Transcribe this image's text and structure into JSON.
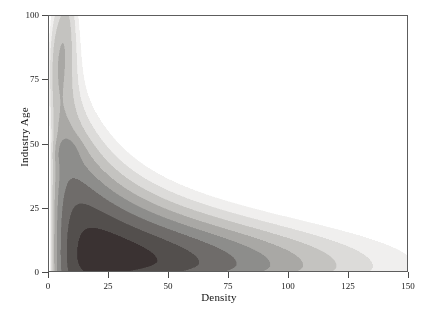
{
  "chart_data": {
    "type": "heatmap",
    "subtype": "filled-contour-density",
    "title": "",
    "xlabel": "Density",
    "ylabel": "Industry Age",
    "xlim": [
      0,
      150
    ],
    "ylim": [
      0,
      100
    ],
    "xticks": [
      0,
      25,
      50,
      75,
      100,
      125,
      150
    ],
    "xticklabels": [
      "0",
      "25",
      "50",
      "75",
      "100",
      "125",
      "150"
    ],
    "yticks": [
      0,
      25,
      50,
      75,
      100
    ],
    "yticklabels": [
      "0",
      "25",
      "50",
      "75",
      "100"
    ],
    "grid": false,
    "legend": null,
    "colormap": "grayscale-reversed",
    "colormap_note": "low density = white, high density = near-black brown",
    "levels": [
      0.02,
      0.06,
      0.12,
      0.2,
      0.3,
      0.42,
      0.56,
      0.72,
      0.88,
      1.0
    ],
    "level_colors": [
      "#ffffff",
      "#f0efee",
      "#dcdbd9",
      "#c4c3c0",
      "#a9a8a5",
      "#8d8d8b",
      "#6f6c6a",
      "#534f4d",
      "#3a3232",
      "#241a18"
    ],
    "modes": [
      {
        "x": 28,
        "y": 4,
        "intensity": 1.0,
        "label": "primary mode"
      },
      {
        "x": 8,
        "y": 90,
        "intensity": 0.22,
        "label": "upper secondary lobe"
      },
      {
        "x": 7,
        "y": 47,
        "intensity": 0.13,
        "label": "middle secondary lobe"
      }
    ],
    "ridge_x": [
      3,
      5,
      10,
      15,
      20,
      25,
      30,
      40,
      50,
      60,
      70,
      80,
      90,
      100,
      110,
      120,
      130,
      140,
      146
    ],
    "ridge_upper_y": [
      14,
      30,
      41,
      44,
      43,
      41,
      39,
      35,
      31,
      28,
      25,
      22,
      19,
      17,
      14,
      12,
      9,
      5,
      2
    ],
    "ridge_peak_y": [
      0,
      2,
      5,
      7,
      8,
      8,
      8,
      7,
      7,
      6,
      6,
      5,
      5,
      4,
      4,
      3,
      2,
      1,
      0
    ]
  },
  "axes": {
    "x_title": "Density",
    "y_title": "Industry Age"
  }
}
